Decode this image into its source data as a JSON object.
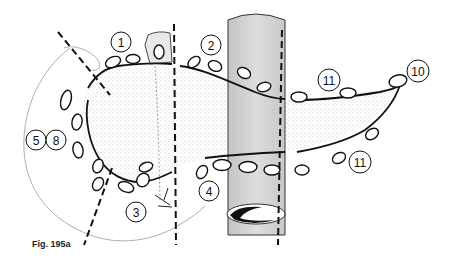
{
  "figure": {
    "caption": "Fig. 195a",
    "type": "anatomical line drawing"
  },
  "station_labels": [
    {
      "id": "1",
      "label": "1"
    },
    {
      "id": "2",
      "label": "2"
    },
    {
      "id": "3",
      "label": "3"
    },
    {
      "id": "4",
      "label": "4"
    },
    {
      "id": "5",
      "label": "5"
    },
    {
      "id": "8",
      "label": "8"
    },
    {
      "id": "10",
      "label": "10"
    },
    {
      "id": "11a",
      "label": "11"
    },
    {
      "id": "11b",
      "label": "11"
    }
  ],
  "colors": {
    "line": "#111111",
    "vessel_fill": "#d6d6d6",
    "stipple": "#c8c8c8",
    "thin_outline": "#9a9a9a"
  }
}
